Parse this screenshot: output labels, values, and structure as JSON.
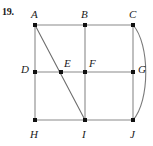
{
  "figure": {
    "problem_number": "19.",
    "background_color": "#ffffff",
    "line_color": "#8a8a8a",
    "vertex_color": "#111111",
    "label_color": "#1a1a1a",
    "width": 153,
    "height": 146,
    "vertices": [
      {
        "id": "A",
        "label": "A",
        "x": 35,
        "y": 25,
        "label_x": 31,
        "label_y": 9
      },
      {
        "id": "B",
        "label": "B",
        "x": 85,
        "y": 25,
        "label_x": 81,
        "label_y": 9
      },
      {
        "id": "C",
        "label": "C",
        "x": 133,
        "y": 25,
        "label_x": 129,
        "label_y": 9
      },
      {
        "id": "D",
        "label": "D",
        "x": 35,
        "y": 72,
        "label_x": 21,
        "label_y": 64
      },
      {
        "id": "E",
        "label": "E",
        "x": 61,
        "y": 72,
        "label_x": 64,
        "label_y": 58
      },
      {
        "id": "F",
        "label": "F",
        "x": 85,
        "y": 72,
        "label_x": 89,
        "label_y": 58
      },
      {
        "id": "G",
        "label": "G",
        "x": 133,
        "y": 72,
        "label_x": 138,
        "label_y": 64
      },
      {
        "id": "H",
        "label": "H",
        "x": 35,
        "y": 120,
        "label_x": 30,
        "label_y": 129
      },
      {
        "id": "I",
        "label": "I",
        "x": 85,
        "y": 120,
        "label_x": 82,
        "label_y": 129
      },
      {
        "id": "J",
        "label": "J",
        "x": 133,
        "y": 120,
        "label_x": 130,
        "label_y": 129
      }
    ],
    "edges": [
      {
        "id": "A-B",
        "from": "A",
        "to": "B",
        "x1": 35,
        "y1": 25,
        "x2": 85,
        "y2": 25
      },
      {
        "id": "B-C",
        "from": "B",
        "to": "C",
        "x1": 85,
        "y1": 25,
        "x2": 133,
        "y2": 25
      },
      {
        "id": "D-E",
        "from": "D",
        "to": "E",
        "x1": 35,
        "y1": 72,
        "x2": 61,
        "y2": 72
      },
      {
        "id": "E-F",
        "from": "E",
        "to": "F",
        "x1": 61,
        "y1": 72,
        "x2": 85,
        "y2": 72
      },
      {
        "id": "F-G",
        "from": "F",
        "to": "G",
        "x1": 85,
        "y1": 72,
        "x2": 133,
        "y2": 72
      },
      {
        "id": "H-I",
        "from": "H",
        "to": "I",
        "x1": 35,
        "y1": 120,
        "x2": 85,
        "y2": 120
      },
      {
        "id": "I-J",
        "from": "I",
        "to": "J",
        "x1": 85,
        "y1": 120,
        "x2": 133,
        "y2": 120
      },
      {
        "id": "A-D",
        "from": "A",
        "to": "D",
        "x1": 35,
        "y1": 25,
        "x2": 35,
        "y2": 72
      },
      {
        "id": "D-H",
        "from": "D",
        "to": "H",
        "x1": 35,
        "y1": 72,
        "x2": 35,
        "y2": 120
      },
      {
        "id": "B-F",
        "from": "B",
        "to": "F",
        "x1": 85,
        "y1": 25,
        "x2": 85,
        "y2": 72
      },
      {
        "id": "F-I",
        "from": "F",
        "to": "I",
        "x1": 85,
        "y1": 72,
        "x2": 85,
        "y2": 120
      },
      {
        "id": "C-G",
        "from": "C",
        "to": "G",
        "x1": 133,
        "y1": 25,
        "x2": 133,
        "y2": 72
      },
      {
        "id": "G-J",
        "from": "G",
        "to": "J",
        "x1": 133,
        "y1": 72,
        "x2": 133,
        "y2": 120
      },
      {
        "id": "A-I",
        "from": "A",
        "to": "I",
        "x1": 35,
        "y1": 25,
        "x2": 85,
        "y2": 120
      }
    ],
    "curved_edges": [
      {
        "id": "C-J-arc",
        "from": "C",
        "to": "J",
        "path": "M 133 25 C 150 44, 150 101, 133 120"
      }
    ]
  }
}
